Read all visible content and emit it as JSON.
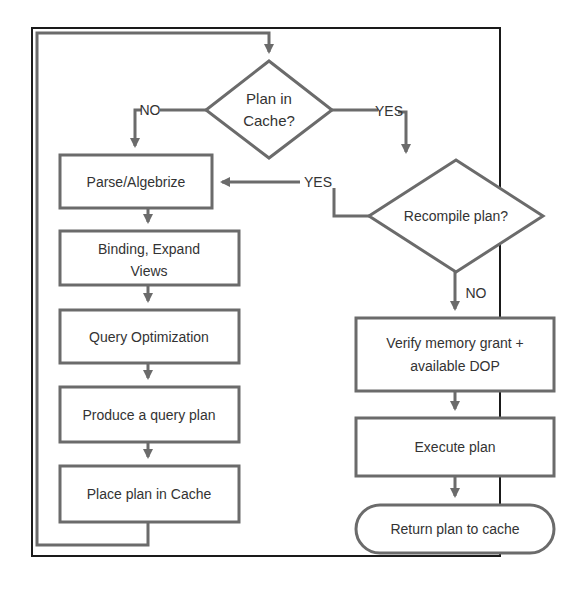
{
  "diagram": {
    "title": "",
    "colors": {
      "line": "#6b6b6b",
      "frame": "#1a1a1a",
      "text": "#333333",
      "fill": "#ffffff"
    },
    "nodes": {
      "plan_in_cache": {
        "type": "decision",
        "line1": "Plan in",
        "line2": "Cache?"
      },
      "recompile": {
        "type": "decision",
        "label": "Recompile plan?"
      },
      "parse": {
        "type": "process",
        "label": "Parse/Algebrize"
      },
      "binding": {
        "type": "process",
        "line1": "Binding, Expand",
        "line2": "Views"
      },
      "optimize": {
        "type": "process",
        "label": "Query Optimization"
      },
      "produce": {
        "type": "process",
        "label": "Produce a query plan"
      },
      "place": {
        "type": "process",
        "label": "Place plan in Cache"
      },
      "verify": {
        "type": "process",
        "line1": "Verify memory grant +",
        "line2": "available DOP"
      },
      "execute": {
        "type": "process",
        "label": "Execute plan"
      },
      "return": {
        "type": "terminal",
        "label": "Return plan to cache"
      }
    },
    "edge_labels": {
      "cache_no": "NO",
      "cache_yes": "YES",
      "recompile_yes": "YES",
      "recompile_no": "NO"
    },
    "edges": [
      {
        "from": "plan_in_cache",
        "to": "parse",
        "label": "NO"
      },
      {
        "from": "plan_in_cache",
        "to": "recompile",
        "label": "YES"
      },
      {
        "from": "recompile",
        "to": "parse",
        "label": "YES"
      },
      {
        "from": "recompile",
        "to": "verify",
        "label": "NO"
      },
      {
        "from": "parse",
        "to": "binding"
      },
      {
        "from": "binding",
        "to": "optimize"
      },
      {
        "from": "optimize",
        "to": "produce"
      },
      {
        "from": "produce",
        "to": "place"
      },
      {
        "from": "place",
        "to": "plan_in_cache"
      },
      {
        "from": "verify",
        "to": "execute"
      },
      {
        "from": "execute",
        "to": "return"
      }
    ]
  }
}
